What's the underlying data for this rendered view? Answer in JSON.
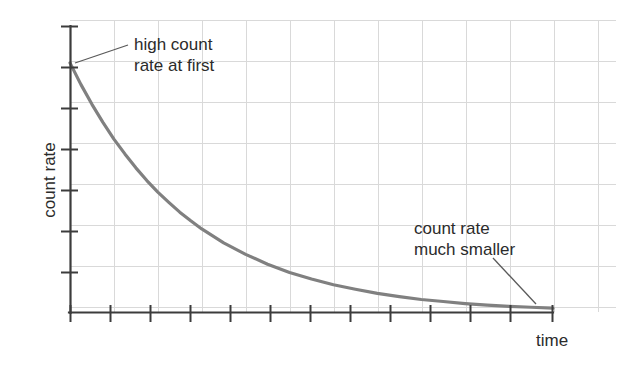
{
  "figure": {
    "width": 620,
    "height": 376,
    "background": "#ffffff"
  },
  "axes": {
    "ylabel": "count rate",
    "xlabel": "time",
    "axis_color": "#3c3c3c",
    "grid_color": "#d8d8d8"
  },
  "annotations": {
    "high": "high count\nrate at first",
    "low": "count rate\nmuch smaller"
  },
  "chart_data": {
    "type": "line",
    "title": "",
    "xlabel": "time",
    "ylabel": "count rate",
    "grid": true,
    "legend": null,
    "curve_color": "#808080",
    "xlim": [
      0,
      11
    ],
    "ylim": [
      0,
      7
    ],
    "x_tick_count": 13,
    "y_tick_count": 7,
    "x_tick_labels": [],
    "y_tick_labels": [],
    "series": [
      {
        "name": "count rate",
        "model": "exponential-decay",
        "initial_value": 6.1,
        "half_life": 1.85,
        "x": [
          0,
          0.25,
          0.5,
          0.75,
          1.0,
          1.25,
          1.5,
          1.75,
          2.0,
          2.25,
          2.5,
          2.75,
          3.0,
          3.5,
          4.0,
          4.5,
          5.0,
          5.5,
          6.0,
          6.5,
          7.0,
          7.5,
          8.0,
          8.5,
          9.0,
          9.5,
          10.0,
          10.5,
          11.0
        ],
        "y": [
          6.1,
          5.57,
          5.09,
          4.65,
          4.24,
          3.88,
          3.54,
          3.23,
          2.95,
          2.7,
          2.46,
          2.25,
          2.05,
          1.71,
          1.43,
          1.19,
          0.99,
          0.83,
          0.69,
          0.58,
          0.48,
          0.4,
          0.33,
          0.28,
          0.23,
          0.19,
          0.16,
          0.14,
          0.12
        ]
      }
    ],
    "annotations": [
      {
        "text": "high count rate at first",
        "points_to_x": 0.08,
        "points_to_y": 5.6
      },
      {
        "text": "count rate much smaller",
        "points_to_x": 10.4,
        "points_to_y": 0.17
      }
    ]
  }
}
